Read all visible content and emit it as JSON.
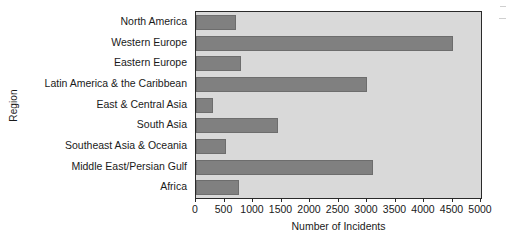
{
  "chart_data": {
    "type": "bar",
    "orientation": "horizontal",
    "title": "",
    "xlabel": "Number of Incidents",
    "ylabel": "Region",
    "categories": [
      "North America",
      "Western Europe",
      "Eastern Europe",
      "Latin America & the Caribbean",
      "East & Central Asia",
      "South Asia",
      "Southeast Asia & Oceania",
      "Middle East/Persian Gulf",
      "Africa"
    ],
    "values": [
      700,
      4500,
      790,
      3000,
      300,
      1440,
      530,
      3100,
      760
    ],
    "xlim": [
      0,
      5000
    ],
    "xticks": [
      0,
      500,
      1000,
      1500,
      2000,
      2500,
      3000,
      3500,
      4000,
      4500,
      5000
    ],
    "xtick_labels": [
      "0",
      "500",
      "1000",
      "1500",
      "2000",
      "2500",
      "3000",
      "3500",
      "4000",
      "4500",
      "5000"
    ],
    "grid": false,
    "legend": null,
    "bar_color": "#808080",
    "plot_background": "#d9d9d9",
    "axis_color": "#2a2a2a",
    "figure_background": "#ffffff"
  }
}
